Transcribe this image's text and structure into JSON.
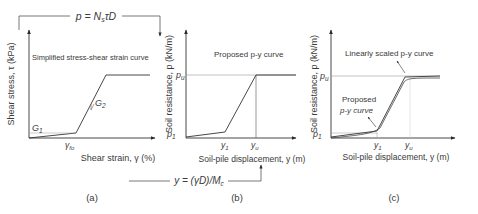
{
  "top_relation": {
    "formula": "p = N",
    "formula_sub": "s",
    "formula_tail": "τD"
  },
  "bottom_relation": {
    "formula": "y = (γD)/M",
    "formula_sub": "c"
  },
  "panel_a": {
    "caption": "(a)",
    "title": "Simplified stress-shear strain curve",
    "y_label": "Shear stress, τ (kPa)",
    "x_label": "Shear strain, γ (%)",
    "g1_label": "G",
    "g1_sub": "1",
    "g2_label": "G",
    "g2_sub": "2",
    "x_tick": "γ",
    "x_tick_sub": "fo"
  },
  "panel_b": {
    "caption": "(b)",
    "title": "Proposed p-y curve",
    "y_label": "Soil resistance, p (kN/m)",
    "x_label": "Soil-pile displacement, y (m)",
    "pu_label": "p",
    "pu_sub": "u",
    "p1_label": "p",
    "p1_sub": "1",
    "y1_label": "y",
    "y1_sub": "1",
    "yu_label": "y",
    "yu_sub": "u"
  },
  "panel_c": {
    "caption": "(c)",
    "annotation_scaled": "Linearly scaled p-y curve",
    "annotation_proposed_line1": "Proposed",
    "annotation_proposed_line2": "p-y curve",
    "y_label": "Soil resistance, p (kN/m)",
    "x_label": "Soil-pile displacement, y (m)",
    "pu_label": "p",
    "pu_sub": "u",
    "p1_label": "p",
    "p1_sub": "1",
    "y1_label": "y",
    "y1_sub": "1",
    "yu_label": "y",
    "yu_sub": "u"
  },
  "colors": {
    "line": "#3a3a3a",
    "guide": "#9a9a9a"
  }
}
